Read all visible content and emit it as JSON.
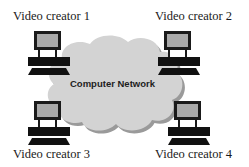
{
  "diagram": {
    "network": {
      "label": "Computer Network",
      "icon": "cloud-icon",
      "fill_color": "#d3d3d3",
      "shadow_color": "#9a9a9a"
    },
    "nodes": [
      {
        "id": "creator-1",
        "label": "Video creator 1",
        "icon": "computer-icon",
        "position": "top-left"
      },
      {
        "id": "creator-2",
        "label": "Video creator 2",
        "icon": "computer-icon",
        "position": "top-right"
      },
      {
        "id": "creator-3",
        "label": "Video creator 3",
        "icon": "computer-icon",
        "position": "bottom-left"
      },
      {
        "id": "creator-4",
        "label": "Video creator 4",
        "icon": "computer-icon",
        "position": "bottom-right"
      }
    ],
    "colors": {
      "monitor_body": "#1a1a1a",
      "monitor_screen": "#a9a9a9",
      "background": "#ffffff",
      "text": "#1a1a1a"
    }
  }
}
